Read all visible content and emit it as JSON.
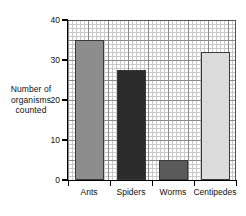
{
  "chart_data": {
    "type": "bar",
    "title": "",
    "xlabel": "",
    "ylabel": "Number of organisms counted",
    "ylim": [
      0,
      40
    ],
    "yticks": [
      0,
      10,
      20,
      30,
      40
    ],
    "grid": "graph-paper minor and major gridlines",
    "legend": "none",
    "categories": [
      "Ants",
      "Spiders",
      "Worms",
      "Centipedes"
    ],
    "values": [
      35,
      27.5,
      5,
      32
    ],
    "bar_colors": [
      "#8d8d8d",
      "#2b2b2b",
      "#5a5a5a",
      "#dcdcdc"
    ]
  },
  "axis": {
    "y_title_lines": [
      "Number of",
      "organisms",
      "counted"
    ],
    "y_tick_labels": [
      "0",
      "10",
      "20",
      "30",
      "40"
    ],
    "x_tick_labels": [
      "Ants",
      "Spiders",
      "Worms",
      "Centipedes"
    ]
  },
  "colors": {
    "background": "#ffffff",
    "grid_minor": "#c9c9c9",
    "grid_major": "#8a8a8a",
    "axis": "#000000",
    "text": "#111111"
  }
}
